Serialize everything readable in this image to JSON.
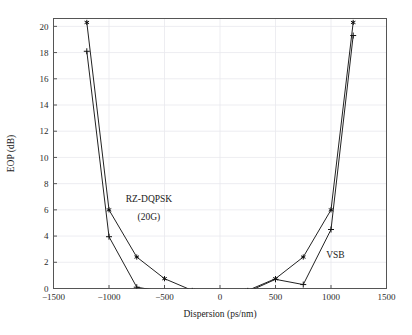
{
  "chart_data": {
    "type": "line",
    "title": "",
    "xlabel": "Dispersion (ps/nm)",
    "ylabel": "EOP (dB)",
    "xlim": [
      -1500,
      1500
    ],
    "ylim": [
      0,
      20.6
    ],
    "xticks": [
      -1500,
      -1000,
      -500,
      0,
      500,
      1000,
      1500
    ],
    "xticklabels": [
      "−1500",
      "−1000",
      "−500",
      "0",
      "500",
      "1000",
      "1500"
    ],
    "yticks": [
      0,
      2,
      4,
      6,
      8,
      10,
      12,
      14,
      16,
      18,
      20
    ],
    "yticklabels": [
      "0",
      "2",
      "4",
      "6",
      "8",
      "10",
      "12",
      "14",
      "16",
      "18",
      "20"
    ],
    "grid": true,
    "legend_position": "inline-annotations",
    "series": [
      {
        "name": "RZ-DQPSK (20G)",
        "marker": "star",
        "x": [
          -1200,
          -1000,
          -750,
          -500,
          -250,
          0,
          250,
          500,
          750,
          1000,
          1200
        ],
        "values": [
          20.3,
          6.0,
          2.4,
          0.75,
          -0.15,
          -0.3,
          -0.15,
          0.75,
          2.4,
          6.0,
          20.3
        ]
      },
      {
        "name": "VSB",
        "marker": "plus",
        "x": [
          -1200,
          -1000,
          -750,
          -500,
          -250,
          0,
          250,
          500,
          750,
          1000,
          1200
        ],
        "values": [
          18.1,
          3.95,
          0.1,
          -0.25,
          -0.3,
          -0.3,
          -0.25,
          0.7,
          0.3,
          4.5,
          19.3
        ]
      }
    ],
    "annotations": [
      {
        "text": "RZ-DQPSK",
        "x": -640,
        "y": 6.6
      },
      {
        "text": "(20G)",
        "x": -640,
        "y": 5.2
      },
      {
        "text": "VSB",
        "x": 1040,
        "y": 2.35
      }
    ]
  },
  "colors": {
    "background": "#ffffff",
    "frame": "#555555",
    "grid": "#e9e9ee",
    "line": "#222222",
    "text": "#1a1a1a"
  }
}
